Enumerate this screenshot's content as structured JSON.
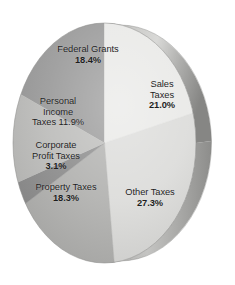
{
  "chart_data": {
    "type": "pie",
    "title": "",
    "subtitle": "",
    "xlabel": "",
    "ylabel": "",
    "grid": false,
    "legend_position": "none",
    "style": "3d-pie-grayscale",
    "label_format": "name + percent",
    "categories": [
      "Federal Grants",
      "Sales Taxes",
      "Other Taxes",
      "Property Taxes",
      "Corporate Profit Taxes",
      "Personal Income Taxes"
    ],
    "values": [
      18.4,
      21.0,
      27.3,
      18.3,
      3.1,
      11.9
    ],
    "units": "percent",
    "total": 100.0,
    "slices": [
      {
        "name": "Federal Grants",
        "value": 18.4,
        "percent_text": "18.4%",
        "color": "#9a9a9a",
        "label_lines": [
          "Federal Grants",
          "18.4%"
        ],
        "start_angle": 293.8,
        "end_angle": 360.0
      },
      {
        "name": "Sales Taxes",
        "value": 21.0,
        "percent_text": "21.0%",
        "color": "#e9e9e7",
        "label_lines": [
          "Sales",
          "Taxes",
          "21.0%"
        ],
        "start_angle": 0.0,
        "end_angle": 75.6
      },
      {
        "name": "Other Taxes",
        "value": 27.3,
        "percent_text": "27.3%",
        "color": "#dcdcda",
        "label_lines": [
          "Other Taxes",
          "27.3%"
        ],
        "start_angle": 75.6,
        "end_angle": 173.9
      },
      {
        "name": "Property Taxes",
        "value": 18.3,
        "percent_text": "18.3%",
        "color": "#b2b2b0",
        "label_lines": [
          "Property Taxes",
          "18.3%"
        ],
        "start_angle": 173.9,
        "end_angle": 239.8
      },
      {
        "name": "Corporate Profit Taxes",
        "value": 3.1,
        "percent_text": "3.1%",
        "color": "#8e8e8e",
        "label_lines": [
          "Corporate",
          "Profit Taxes",
          "3.1%"
        ],
        "start_angle": 239.8,
        "end_angle": 251.0
      },
      {
        "name": "Personal Income Taxes",
        "value": 11.9,
        "percent_text": "11.9%",
        "color": "#bdbdbb",
        "label_lines": [
          "Personal",
          "Income",
          "Taxes 11.9%"
        ],
        "start_angle": 251.0,
        "end_angle": 293.8
      }
    ]
  },
  "labels": {
    "federal_grants": {
      "line1": "Federal Grants",
      "pct": "18.4%"
    },
    "sales_taxes": {
      "line1": "Sales",
      "line2": "Taxes",
      "pct": "21.0%"
    },
    "personal_income_taxes": {
      "line1": "Personal",
      "line2": "Income",
      "line3": "Taxes 11.9%"
    },
    "corporate_profit_taxes": {
      "line1": "Corporate",
      "line2": "Profit Taxes",
      "pct": "3.1%"
    },
    "property_taxes": {
      "line1": "Property Taxes",
      "pct": "18.3%"
    },
    "other_taxes": {
      "line1": "Other Taxes",
      "pct": "27.3%"
    }
  },
  "colors": {
    "background": "#ffffff",
    "text": "#1d1d1d",
    "rim_light": "#cfcfcd",
    "rim_dark": "#8a8a88",
    "edge_outline": "#6f6f6d"
  }
}
